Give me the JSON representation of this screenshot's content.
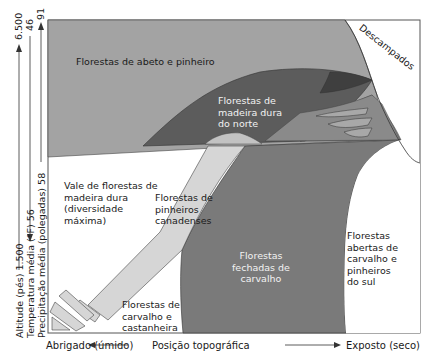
{
  "colors": {
    "fir_pine": "#a3a3a3",
    "northern_hardwood": "#5c5c5c",
    "hardwood_dark_overlap": "#3f3f3f",
    "hemlock": "#d6d6d6",
    "closed_oak": "#7a7a7a",
    "mid_gray": "#8e8e8e",
    "open": "#ffffff",
    "outline": "#333333"
  },
  "regions": {
    "fir_pine": "Florestas de abeto e pinheiro",
    "northern_hardwood": "Florestas de\nmadeira dura\ndo norte",
    "cove_hardwood": "Vale de florestas de\nmadeira dura\n(diversidade\nmáxima)",
    "hemlock": "Florestas de\npinheiros\ncanadenses",
    "closed_oak": "Florestas\nfechadas de\ncarvalho",
    "oak_chestnut": "Florestas de\ncarvalho e\ncastanheira",
    "open_oak_pine": "Florestas\nabertas de\ncarvalho e\npinheiros\ndo sul",
    "balds": "Descampados"
  },
  "y_axes": {
    "altitude": {
      "label": "Altitude (pés)",
      "low": "1.500",
      "high": "6.500"
    },
    "temperature": {
      "label": "Temperatura média (°F)",
      "low": "56",
      "high": "46"
    },
    "precipitation": {
      "label": "Precipitação média (polegadas)",
      "low": "58",
      "high": "91"
    }
  },
  "x_axis": {
    "left": "Abrigado (úmido)",
    "center": "Posição topográfica",
    "right": "Exposto (seco)"
  }
}
